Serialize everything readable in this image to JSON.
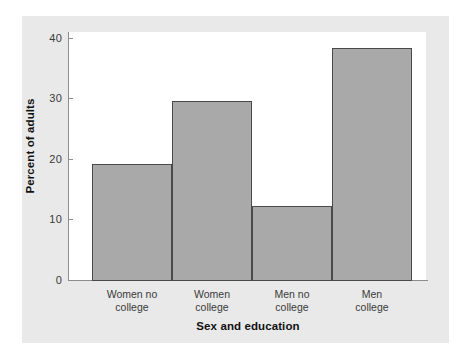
{
  "chart_data": {
    "type": "bar",
    "title": "",
    "subtitle": "",
    "xlabel": "Sex and education",
    "ylabel": "Percent of adults",
    "categories": [
      "Women no college",
      "Women college",
      "Men no college",
      "Men college"
    ],
    "category_lines": [
      [
        "Women no",
        "college"
      ],
      [
        "Women",
        "college"
      ],
      [
        "Men no",
        "college"
      ],
      [
        "Men",
        "college"
      ]
    ],
    "values": [
      19.2,
      29.6,
      12.3,
      38.3
    ],
    "ylim": [
      0,
      40
    ],
    "yticks": [
      0,
      10,
      20,
      30,
      40
    ],
    "ytick_labels": [
      "0",
      "10",
      "20",
      "30",
      "40"
    ],
    "grid": false,
    "legend": null,
    "bar_fill_color": "#a9a9a9",
    "bar_edge_color": "#4a4a4a",
    "plot_background": "#ffffff",
    "panel_background": "#e9e9e9",
    "axis_color": "#8d8d8d",
    "text_color": "#3a3a3a"
  }
}
